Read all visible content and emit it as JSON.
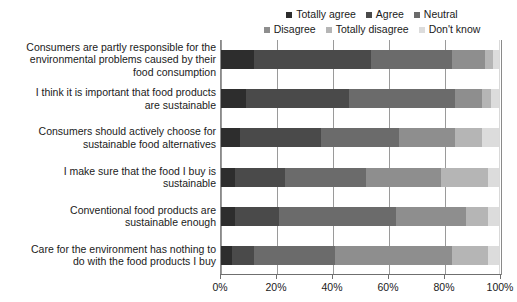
{
  "chart_data": {
    "type": "bar",
    "subtype": "stacked-horizontal-100",
    "title": "",
    "xlabel": "",
    "ylabel": "",
    "xlim": [
      0,
      100
    ],
    "xticks": [
      0,
      20,
      40,
      60,
      80,
      100
    ],
    "xtick_labels": [
      "0%",
      "20%",
      "40%",
      "60%",
      "80%",
      "100%"
    ],
    "grid": true,
    "legend_position": "top",
    "categories": [
      "Consumers are partly responsible for the environmental problems caused by their food consumption",
      "I think it is important that food products are sustainable",
      "Consumers should actively choose for sustainable food alternatives",
      "I make sure that the food I buy is sustainable",
      "Conventional food products are sustainable enough",
      "Care for the environment has nothing to do with the food products I buy"
    ],
    "category_lines": [
      [
        "Consumers are partly responsible for the",
        "environmental problems caused by their",
        "food consumption"
      ],
      [
        "I think it is important that food products",
        "are sustainable"
      ],
      [
        "Consumers should actively choose for",
        "sustainable food alternatives"
      ],
      [
        "I make sure that the food I buy is",
        "sustainable"
      ],
      [
        "Conventional food products are",
        "sustainable enough"
      ],
      [
        "Care for the environment has nothing to",
        "do with the food products I buy"
      ]
    ],
    "series": [
      {
        "name": "Totally agree",
        "color": "#2d2d2d",
        "values": [
          12,
          9,
          7,
          5,
          5,
          4
        ]
      },
      {
        "name": "Agree",
        "color": "#4a4a4a",
        "values": [
          42,
          37,
          29,
          18,
          16,
          8
        ]
      },
      {
        "name": "Neutral",
        "color": "#6b6b6b",
        "values": [
          29,
          38,
          28,
          29,
          42,
          29
        ]
      },
      {
        "name": "Disagree",
        "color": "#8e8e8e",
        "values": [
          12,
          10,
          20,
          27,
          25,
          42
        ]
      },
      {
        "name": "Totally disagree",
        "color": "#b5b5b5",
        "values": [
          3,
          3,
          10,
          17,
          8,
          13
        ]
      },
      {
        "name": "Don't know",
        "color": "#dcdcdc",
        "values": [
          2,
          3,
          6,
          4,
          4,
          4
        ]
      }
    ]
  },
  "legend": {
    "rows": [
      [
        "Totally agree",
        "Agree",
        "Neutral"
      ],
      [
        "Disagree",
        "Totally disagree",
        "Don't know"
      ]
    ]
  }
}
